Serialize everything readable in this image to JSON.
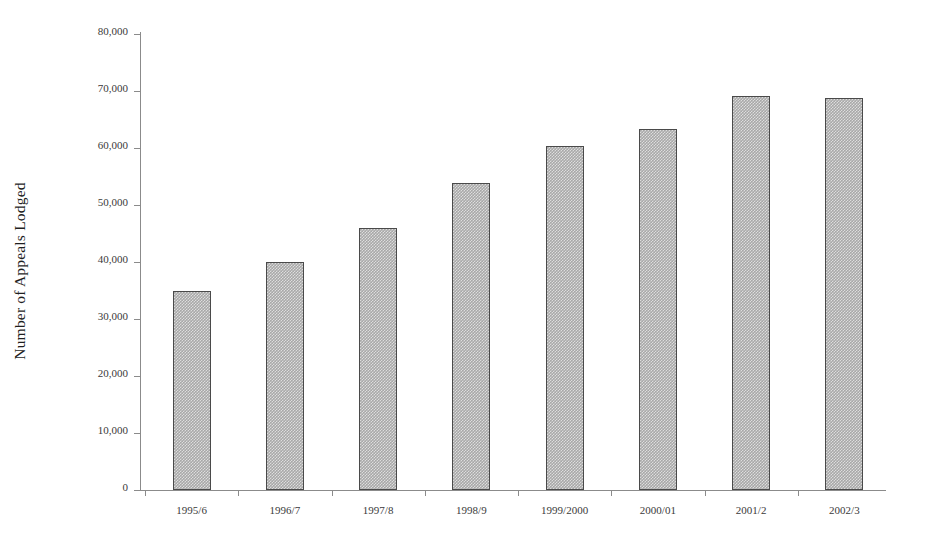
{
  "chart_data": {
    "type": "bar",
    "title": "",
    "xlabel": "",
    "ylabel": "Number of Appeals Lodged",
    "categories": [
      "1995/6",
      "1996/7",
      "1997/8",
      "1998/9",
      "1999/2000",
      "2000/01",
      "2001/2",
      "2002/3"
    ],
    "values": [
      35000,
      40000,
      46000,
      53800,
      60400,
      63400,
      69100,
      68800
    ],
    "ylim": [
      0,
      80000
    ],
    "ytick_values": [
      0,
      10000,
      20000,
      30000,
      40000,
      50000,
      60000,
      70000,
      80000
    ],
    "ytick_labels": [
      "0",
      "10,000",
      "20,000",
      "30,000",
      "40,000",
      "50,000",
      "60,000",
      "70,000",
      "80,000"
    ],
    "grid": false,
    "legend": false,
    "legend_position": "none",
    "series": [
      {
        "name": "Number of Appeals Lodged",
        "values": [
          35000,
          40000,
          46000,
          53800,
          60400,
          63400,
          69100,
          68800
        ]
      }
    ],
    "bar_fill_color": "#a8a8a8",
    "bar_border_color": "#4a4a4a",
    "axis_color": "#8b8b8b",
    "background_color": "#ffffff"
  }
}
